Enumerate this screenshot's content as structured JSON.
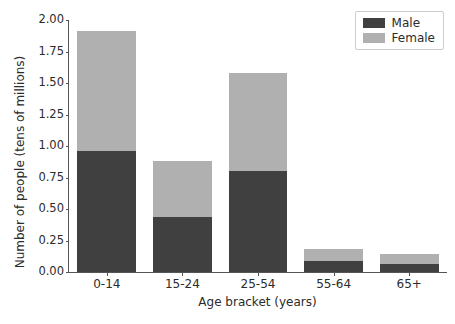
{
  "chart_data": {
    "type": "bar",
    "barmode": "stacked",
    "title": "",
    "xlabel": "Age bracket (years)",
    "ylabel": "Number of people (tens of millions)",
    "categories": [
      "0-14",
      "15-24",
      "25-54",
      "55-64",
      "65+"
    ],
    "series": [
      {
        "name": "Male",
        "color": "#404040",
        "values": [
          0.96,
          0.44,
          0.8,
          0.09,
          0.06
        ]
      },
      {
        "name": "Female",
        "color": "#b0b0b0",
        "values": [
          0.95,
          0.44,
          0.78,
          0.09,
          0.08
        ]
      }
    ],
    "totals": [
      1.91,
      0.88,
      1.58,
      0.18,
      0.14
    ],
    "ylim": [
      0.0,
      2.0
    ],
    "yticks": [
      "0.00",
      "0.25",
      "0.50",
      "0.75",
      "1.00",
      "1.25",
      "1.50",
      "1.75",
      "2.00"
    ],
    "ytick_values": [
      0.0,
      0.25,
      0.5,
      0.75,
      1.0,
      1.25,
      1.5,
      1.75,
      2.0
    ],
    "xtick_labels": [
      "0-14",
      "15-24",
      "25-54",
      "55-64",
      "65+"
    ],
    "grid": false,
    "legend": {
      "position": "upper right",
      "entries": [
        {
          "label": "Male",
          "color": "#404040"
        },
        {
          "label": "Female",
          "color": "#b0b0b0"
        }
      ]
    },
    "bar_width_fraction": 0.78
  }
}
